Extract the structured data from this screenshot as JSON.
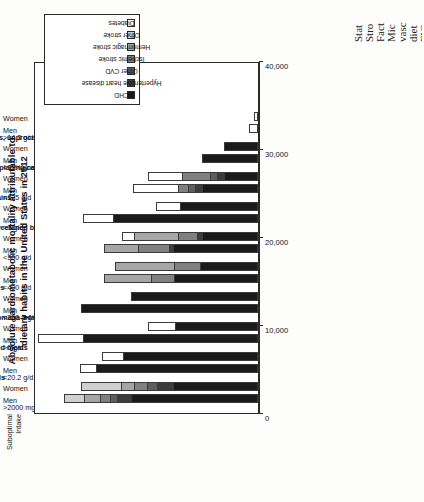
{
  "title": {
    "line1": "Absolute cardiometabolic mortality attributable to",
    "line2": "dietary habits in the United States in 2012"
  },
  "suboptimal_header": {
    "line1": "Suboptimal",
    "line2": "Intake"
  },
  "axis": {
    "ticks": [
      "0",
      "10,000",
      "20,000",
      "30,000",
      "40,000"
    ],
    "min": 0,
    "max": 40000
  },
  "legend": {
    "items": [
      {
        "label": "CHD",
        "color": "#1a1a1a"
      },
      {
        "label": "Hypertensive heart disease",
        "color": "#3c3c3c"
      },
      {
        "label": "Other CVD",
        "color": "#5e5e5e"
      },
      {
        "label": "Ischemic stroke",
        "color": "#808080"
      },
      {
        "label": "Hemorrhagic stroke",
        "color": "#a6a6a6"
      },
      {
        "label": "Other stroke",
        "color": "#d0d0d0"
      },
      {
        "label": "Diabetes",
        "color": "#ffffff"
      }
    ]
  },
  "caption_fragments": [
    "FIG",
    "diet",
    "vasc",
    "Mic",
    "Fact",
    "Stro",
    "Stat"
  ],
  "chart_data": {
    "type": "bar",
    "title": "Absolute cardiometabolic mortality attributable to dietary habits in the United States in 2012",
    "xlabel": "",
    "ylabel": "Absolute cardiometabolic mortality",
    "ylim": [
      0,
      40000
    ],
    "orientation": "vertical-stacked-rotated",
    "grid": false,
    "legend_position": "top-right",
    "series": [
      {
        "name": "CHD",
        "color": "#1a1a1a"
      },
      {
        "name": "Hypertensive heart disease",
        "color": "#3c3c3c"
      },
      {
        "name": "Other CVD",
        "color": "#5e5e5e"
      },
      {
        "name": "Ischemic stroke",
        "color": "#808080"
      },
      {
        "name": "Hemorrhagic stroke",
        "color": "#a6a6a6"
      },
      {
        "name": "Other stroke",
        "color": "#d0d0d0"
      },
      {
        "name": "Diabetes",
        "color": "#ffffff"
      }
    ],
    "groups": [
      {
        "category": "High sodium",
        "threshold": ">2000 mg/d",
        "bars": [
          {
            "sex": "Men",
            "values": [
              22600,
              2400,
              1300,
              1800,
              2900,
              3500,
              0
            ],
            "total": 34500
          },
          {
            "sex": "Women",
            "values": [
              15200,
              2800,
              1800,
              2300,
              2200,
              7200,
              0
            ],
            "total": 31500
          }
        ]
      },
      {
        "category": "Low nuts/seeds",
        "threshold": "<20.2 g/d",
        "bars": [
          {
            "sex": "Men",
            "values": [
              28800,
              0,
              0,
              0,
              0,
              0,
              2800
            ],
            "total": 31600
          },
          {
            "sex": "Women",
            "values": [
              24000,
              0,
              0,
              0,
              0,
              0,
              3700
            ],
            "total": 27700
          }
        ]
      },
      {
        "category": "High processed meats",
        "threshold": ">0 g/d",
        "bars": [
          {
            "sex": "Men",
            "values": [
              31100,
              0,
              0,
              0,
              0,
              0,
              8000
            ],
            "total": 39100
          },
          {
            "sex": "Women",
            "values": [
              14800,
              0,
              0,
              0,
              0,
              0,
              4700
            ],
            "total": 19500
          }
        ]
      },
      {
        "category": "Low seafood omega-3 fats",
        "threshold": "<250 mg/d",
        "bars": [
          {
            "sex": "Men",
            "values": [
              31400,
              0,
              0,
              0,
              0,
              0,
              0
            ],
            "total": 31400
          },
          {
            "sex": "Women",
            "values": [
              22600,
              0,
              0,
              0,
              0,
              0,
              0
            ],
            "total": 22600
          }
        ]
      },
      {
        "category": "Low vegetables",
        "threshold": "<400 g/d",
        "bars": [
          {
            "sex": "Men",
            "values": [
              15000,
              0,
              0,
              4100,
              8300,
              0,
              0
            ],
            "total": 27400
          },
          {
            "sex": "Women",
            "values": [
              10300,
              0,
              0,
              4600,
              10600,
              0,
              0
            ],
            "total": 25500
          }
        ]
      },
      {
        "category": "Low fruits",
        "threshold": "<300 g/d",
        "bars": [
          {
            "sex": "Men",
            "values": [
              15100,
              700,
              0,
              5500,
              6100,
              0,
              0
            ],
            "total": 27400
          },
          {
            "sex": "Women",
            "values": [
              9900,
              900,
              0,
              3500,
              7800,
              0,
              2000
            ],
            "total": 24100
          }
        ]
      },
      {
        "category": "High sugar-sweetened beverages",
        "threshold": ">0 g/d",
        "bars": [
          {
            "sex": "Men",
            "values": [
              25700,
              0,
              0,
              0,
              0,
              0,
              5500
            ],
            "total": 31200
          },
          {
            "sex": "Women",
            "values": [
              13800,
              0,
              0,
              0,
              0,
              0,
              4300
            ],
            "total": 18100
          }
        ]
      },
      {
        "category": "Low whole grains",
        "threshold": "<125 g/d",
        "bars": [
          {
            "sex": "Men",
            "values": [
              9900,
              1300,
              1200,
              1900,
              0,
              0,
              8000
            ],
            "total": 22300
          },
          {
            "sex": "Women",
            "values": [
              6000,
              1300,
              1200,
              5100,
              0,
              0,
              6000
            ],
            "total": 19600
          }
        ]
      },
      {
        "category": "Low PUFAs replacing carbs or saturated fats",
        "threshold": "<11% energy/d",
        "bars": [
          {
            "sex": "Men",
            "values": [
              10000,
              0,
              0,
              0,
              0,
              0,
              0
            ],
            "total": 10000
          },
          {
            "sex": "Women",
            "values": [
              6100,
              0,
              0,
              0,
              0,
              0,
              0
            ],
            "total": 6100
          }
        ]
      },
      {
        "category": "High red meats, unprocessed",
        "threshold": ">14.3 g/d",
        "bars": [
          {
            "sex": "Men",
            "values": [
              0,
              0,
              0,
              0,
              0,
              0,
              1600
            ],
            "total": 1600
          },
          {
            "sex": "Women",
            "values": [
              0,
              0,
              0,
              0,
              0,
              0,
              800
            ],
            "total": 800
          }
        ]
      }
    ]
  }
}
